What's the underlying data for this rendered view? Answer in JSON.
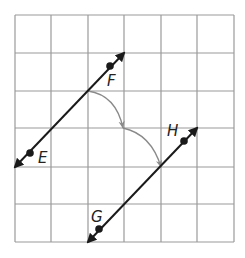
{
  "grid": {
    "cols": 6,
    "rows": 6,
    "x_lines": [
      15,
      51,
      88,
      124,
      161,
      197,
      234
    ],
    "y_lines": [
      15,
      53,
      91,
      128,
      167,
      204,
      242
    ],
    "color": "#9a9a9a"
  },
  "lines": [
    {
      "name": "line-EF",
      "from": [
        15,
        167
      ],
      "to": [
        124,
        53
      ],
      "color": "#1a1a1a",
      "points": [
        {
          "label": "E",
          "at": [
            30,
            153
          ],
          "label_at": [
            38,
            163
          ]
        },
        {
          "label": "F",
          "at": [
            110,
            66
          ],
          "label_at": [
            107,
            86
          ]
        }
      ]
    },
    {
      "name": "line-GH",
      "from": [
        88,
        242
      ],
      "to": [
        197,
        128
      ],
      "color": "#1a1a1a",
      "points": [
        {
          "label": "G",
          "at": [
            99,
            229
          ],
          "label_at": [
            91,
            222
          ]
        },
        {
          "label": "H",
          "at": [
            184,
            141
          ],
          "label_at": [
            167,
            136
          ]
        }
      ]
    }
  ],
  "arc": {
    "from": [
      88,
      91
    ],
    "mid": [
      123,
      128
    ],
    "to": [
      161,
      167
    ],
    "color": "#8a8a8a"
  },
  "labels": {
    "E": "E",
    "F": "F",
    "G": "G",
    "H": "H"
  }
}
